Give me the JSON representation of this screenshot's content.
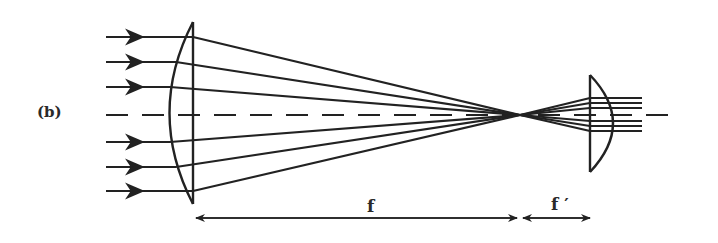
{
  "diagram": {
    "panel_label": "(b)",
    "labels": {
      "focal_length_1": "f",
      "focal_length_2": "f ′"
    },
    "colors": {
      "stroke": "#222222",
      "background": "#ffffff"
    },
    "elements": {
      "input_rays": 6,
      "output_rays": 6,
      "lens_1": "plano-convex (convex side facing input)",
      "lens_2": "plano-convex (convex side facing output)",
      "optical_axis": "dashed"
    }
  }
}
